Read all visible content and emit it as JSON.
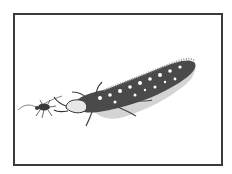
{
  "image": {
    "description": "Pen-and-ink stipple illustration of a lacewing larva approaching an aphid, inside a thin dark rectangular frame",
    "subjects": [
      "lacewing-larva",
      "aphid"
    ],
    "colors": {
      "background": "#ffffff",
      "frame": "#3a3a3a",
      "ink": "#2a2a2a",
      "shade": "#888888"
    }
  }
}
